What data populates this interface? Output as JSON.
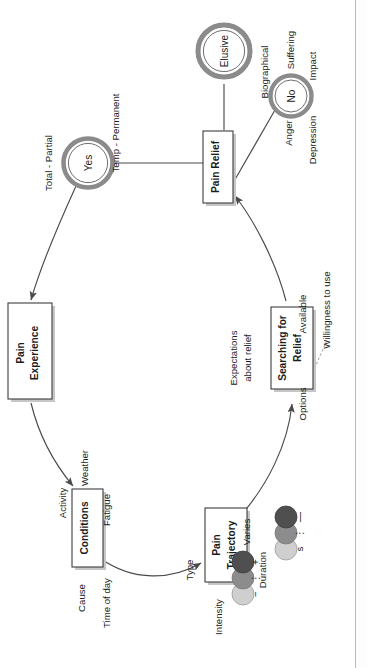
{
  "diagram": {
    "type": "concept-map",
    "orientation": "rotated-90-ccw",
    "title": "",
    "nodes": [
      {
        "id": "pain_experience",
        "label": "Pain\nExperience",
        "line1": "Pain",
        "line2": "Experience",
        "shape": "box"
      },
      {
        "id": "conditions",
        "label": "Conditions",
        "line1": "Conditions",
        "line2": "",
        "shape": "box"
      },
      {
        "id": "pain_trajectory",
        "label": "Pain\nTrajectory",
        "line1": "Pain",
        "line2": "Trajectory",
        "shape": "box"
      },
      {
        "id": "searching",
        "label": "Searching for\nRelief",
        "line1": "Searching for",
        "line2": "Relief",
        "shape": "box"
      },
      {
        "id": "pain_relief",
        "label": "Pain Relief",
        "line1": "Pain Relief",
        "line2": "",
        "shape": "box"
      },
      {
        "id": "yes",
        "label": "Yes",
        "shape": "double-circle"
      },
      {
        "id": "no",
        "label": "No",
        "shape": "double-circle"
      },
      {
        "id": "elusive",
        "label": "Elusive",
        "shape": "double-circle"
      }
    ],
    "attributes": {
      "conditions": [
        "Cause",
        "Activity",
        "Weather",
        "Fatigue",
        "Time of day"
      ],
      "pain_trajectory": [
        "Type",
        "Intensity",
        "Duration",
        "Varies"
      ],
      "searching": [
        "Expectations about relief",
        "Options",
        "Available",
        "Willingness to use"
      ],
      "yes": [
        "Total - Partial",
        "Temp - Permanent"
      ],
      "no": [
        "Biographical",
        "Suffering",
        "Impact",
        "Anger",
        "Depression"
      ]
    },
    "labels": {
      "cause": "Cause",
      "activity": "Activity",
      "weather": "Weather",
      "fatigue": "Fatigue",
      "time_of_day": "Time of day",
      "type": "Type",
      "intensity": "Intensity",
      "duration": "Duration",
      "varies": "Varies",
      "expectations_l1": "Expectations",
      "expectations_l2": "about relief",
      "options": "Options",
      "available": "Available",
      "willingness": "Willingness to use",
      "total_partial": "Total - Partial",
      "temp_permanent": "Temp - Permanent",
      "biographical": "Biographical",
      "suffering": "Suffering",
      "impact": "Impact",
      "anger": "Anger",
      "depression": "Depression"
    },
    "legend": {
      "intensity": {
        "name": "Intensity",
        "marks": [
          "+",
          "⋮",
          "−"
        ],
        "swatches": [
          "#4f4f4f",
          "#8c8c8c",
          "#cfcfcf"
        ]
      },
      "duration": {
        "name": "Duration",
        "marks": [
          "s",
          "⋮",
          "—"
        ],
        "swatches": [
          "#4f4f4f",
          "#8c8c8c",
          "#cfcfcf"
        ]
      }
    },
    "colors": {
      "stroke": "#4a4a4a",
      "ring": "#8b8b8b",
      "box_fill": "#ffffff",
      "box_stroke": "#3c3c3c",
      "shadow": "#c6c6c6",
      "text": "#1c1c1c",
      "dashed": "#8b8b8b"
    }
  }
}
